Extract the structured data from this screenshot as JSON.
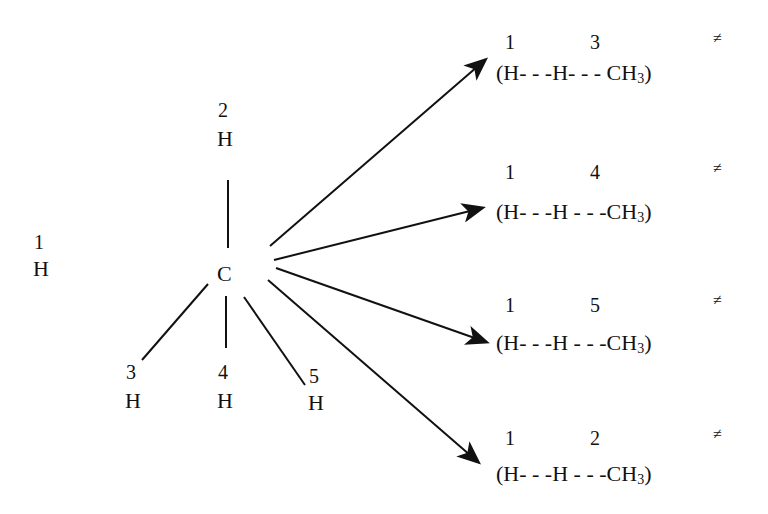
{
  "methane": {
    "center": "C",
    "atoms": [
      {
        "num": "1",
        "sym": "H"
      },
      {
        "num": "2",
        "sym": "H"
      },
      {
        "num": "3",
        "sym": "H"
      },
      {
        "num": "4",
        "sym": "H"
      },
      {
        "num": "5",
        "sym": "H"
      }
    ]
  },
  "transition_states": [
    {
      "a": "1",
      "b": "3",
      "text_h1": "(H",
      "dash1": "- - -",
      "text_h2": "H",
      "dash2": "- - -",
      "ch": "CH",
      "sub": "3",
      "close": ")",
      "mark": "≠"
    },
    {
      "a": "1",
      "b": "4",
      "text_h1": "(H",
      "dash1": "- - -",
      "text_h2": "H",
      "dash2": "- - -",
      "ch": "CH",
      "sub": "3",
      "close": ")",
      "mark": "≠"
    },
    {
      "a": "1",
      "b": "5",
      "text_h1": "(H",
      "dash1": "- - -",
      "text_h2": "H",
      "dash2": "- - -",
      "ch": "CH",
      "sub": "3",
      "close": ")",
      "mark": "≠"
    },
    {
      "a": "1",
      "b": "2",
      "text_h1": "(H",
      "dash1": "- - -",
      "text_h2": "H",
      "dash2": "- - -",
      "ch": "CH",
      "sub": "3",
      "close": ")",
      "mark": "≠"
    }
  ]
}
